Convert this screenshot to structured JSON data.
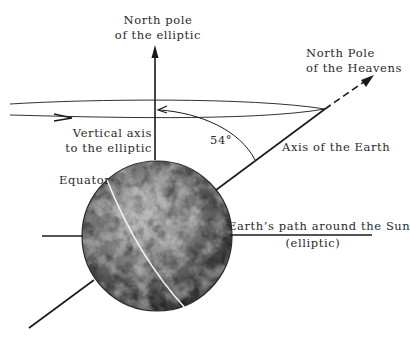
{
  "diagram": {
    "labels": {
      "north_pole_ecliptic_line1": "North pole",
      "north_pole_ecliptic_line2": "of the elliptic",
      "north_pole_heavens_line1": "North Pole",
      "north_pole_heavens_line2": "of the Heavens",
      "vertical_axis_line1": "Vertical axis",
      "vertical_axis_line2": "to the elliptic",
      "angle": "54°",
      "axis_of_earth": "Axis of the Earth",
      "equator": "Equator",
      "earth_path_line1": "Earth’s path around the Sun",
      "earth_path_line2": "(elliptic)"
    },
    "colors": {
      "line": "#1a1a1a",
      "text": "#2a2a2a",
      "background": "#ffffff",
      "globe_dark": "#3a3a3a",
      "globe_light": "#cfcfcf"
    }
  }
}
